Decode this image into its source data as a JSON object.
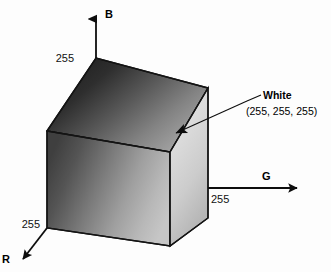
{
  "figure": {
    "name": "rgb-color-cube-diagram",
    "background_color": "#fdfdfd",
    "axes": [
      {
        "id": "blue",
        "label": "B",
        "tick_value": "255",
        "direction": "up"
      },
      {
        "id": "green",
        "label": "G",
        "tick_value": "255",
        "direction": "right"
      },
      {
        "id": "red",
        "label": "R",
        "tick_value": "255",
        "direction": "down-left"
      }
    ],
    "callout": {
      "title": "White",
      "value": "(255, 255, 255)"
    },
    "cube": {
      "top_face_colors": {
        "start": "#1f1f1f",
        "end": "#9a9a9a"
      },
      "front_face_colors": {
        "start": "#464646",
        "end": "#c2c2c2"
      },
      "right_face_colors": {
        "start": "#e3e3e3",
        "end": "#b8b8b8"
      },
      "edge_color": "#141414"
    }
  }
}
